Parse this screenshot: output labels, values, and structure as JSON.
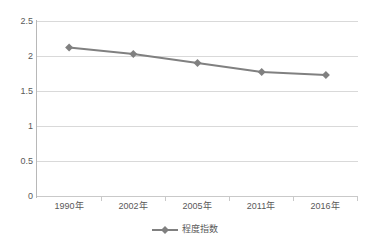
{
  "chart_data": {
    "type": "line",
    "title": "",
    "xlabel": "",
    "ylabel": "",
    "categories": [
      "1990年",
      "2002年",
      "2005年",
      "2011年",
      "2016年"
    ],
    "series": [
      {
        "name": "程度指数",
        "values": [
          2.12,
          2.03,
          1.9,
          1.77,
          1.73
        ],
        "color": "#808080",
        "marker": "diamond"
      }
    ],
    "ylim": [
      0,
      2.5
    ],
    "ytick_step": 0.5,
    "ytick_labels": [
      "0",
      "0.5",
      "1",
      "1.5",
      "2",
      "2.5"
    ],
    "ytick_values": [
      0,
      0.5,
      1,
      1.5,
      2,
      2.5
    ],
    "grid": true,
    "grid_color": "#d9d9d9",
    "legend_position": "bottom",
    "legend_entries": [
      "程度指数"
    ],
    "axis_color": "#b8b8b8",
    "text_color": "#595959",
    "background": "#ffffff"
  },
  "legend": {
    "label": "程度指数",
    "marker_icon": "line-diamond-marker-icon"
  }
}
